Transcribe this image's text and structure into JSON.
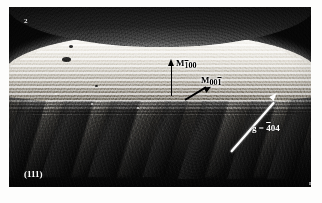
{
  "figure": {
    "type": "electron-micrograph",
    "corner_number": "2",
    "corner_mark": "n",
    "plane_label": "(111)",
    "background_color": "#ffffff",
    "plate_color": "#0c0c0c"
  },
  "annotations": {
    "martensite_variant_1": {
      "symbol": "M",
      "subscript_prefix": "1",
      "subscript_suffix": "00",
      "full": "M100",
      "arrow": "arrow-up",
      "arrow_color": "#000000"
    },
    "martensite_variant_2": {
      "symbol": "M",
      "subscript_prefix": "00",
      "subscript_suffix": "1",
      "full": "M001",
      "arrow": "arrow-up-right",
      "arrow_color": "#000000"
    },
    "diffraction_vector": {
      "symbol": "g",
      "equals": "=",
      "index_bar": "4",
      "index_rest": "04",
      "full": "g = 404",
      "arrow": "arrow-diagonal-up-right",
      "arrow_color": "#ffffff"
    }
  }
}
